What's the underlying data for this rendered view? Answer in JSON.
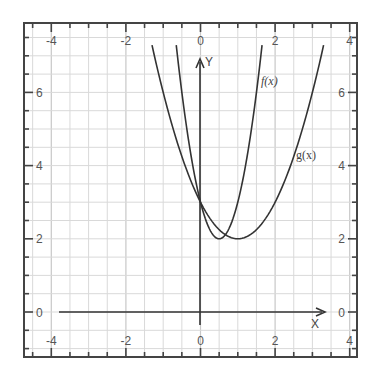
{
  "chart_data": {
    "type": "line",
    "title": "",
    "xlabel": "X",
    "ylabel": "Y",
    "xlim": [
      -4.7,
      4.2
    ],
    "ylim": [
      -0.9,
      7.9
    ],
    "grid": true,
    "grid_step": 0.5,
    "x_ticks": [
      -4,
      -2,
      0,
      2,
      4
    ],
    "y_ticks": [
      0,
      2,
      4,
      6
    ],
    "x_tick_labels_top": [
      "-4",
      "-2",
      "0",
      "2",
      "4"
    ],
    "x_tick_labels_bottom": [
      "-4",
      "-2",
      "0",
      "2",
      "4"
    ],
    "y_tick_labels_left": [
      "0",
      "2",
      "4",
      "6"
    ],
    "y_tick_labels_right": [
      "0",
      "2",
      "4",
      "6"
    ],
    "series": [
      {
        "name": "f(x)",
        "formula": "4(x-0.5)^2+2",
        "x": [
          -0.65,
          -0.5,
          -0.25,
          0,
          0.25,
          0.5,
          0.75,
          1,
          1.25,
          1.5,
          1.65
        ],
        "y": [
          7.29,
          6.0,
          4.25,
          3.0,
          2.25,
          2.0,
          2.25,
          3.0,
          4.25,
          6.0,
          7.29
        ],
        "vertex": [
          0.5,
          2
        ]
      },
      {
        "name": "g(x)",
        "formula": "(x-1)^2+2",
        "x": [
          -1.3,
          -1,
          -0.5,
          0,
          0.5,
          1,
          1.5,
          2,
          2.5,
          3,
          3.3
        ],
        "y": [
          7.29,
          6.0,
          4.25,
          3.0,
          2.25,
          2.0,
          2.25,
          3.0,
          4.25,
          6.0,
          7.29
        ],
        "vertex": [
          1,
          2
        ]
      }
    ],
    "annotations": [
      {
        "text": "f(x)",
        "x": 1.75,
        "y": 6.3
      },
      {
        "text": "g(x)",
        "x": 2.75,
        "y": 4.2
      }
    ],
    "intersection": [
      0,
      3
    ]
  },
  "labels": {
    "x_axis": "X",
    "y_axis": "Y",
    "f": "f(x)",
    "g": "g(x)"
  },
  "colors": {
    "curve": "#333333",
    "axis": "#333333",
    "grid": "#d9d9d9",
    "grid_major": "#c8c8c8",
    "frame": "#444444"
  }
}
